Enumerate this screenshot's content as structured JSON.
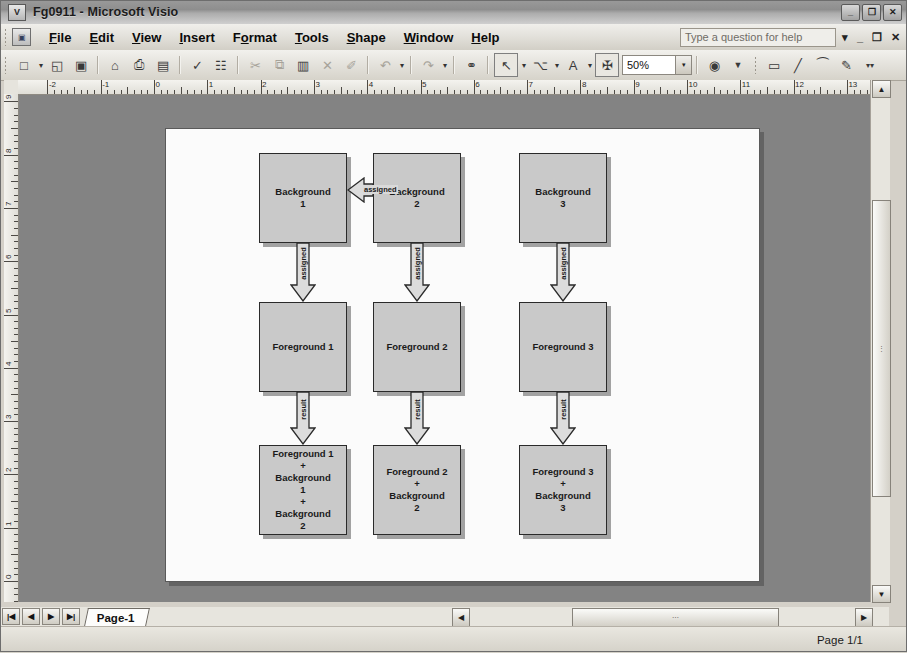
{
  "window": {
    "title": "Fg0911 - Microsoft Visio",
    "app_icon": "visio-icon",
    "minimize_label": "_",
    "restore_label": "❐",
    "close_label": "✕"
  },
  "menubar": {
    "doc_icon": "document-icon",
    "items": [
      {
        "label": "File",
        "accel": "F"
      },
      {
        "label": "Edit",
        "accel": "E"
      },
      {
        "label": "View",
        "accel": "V"
      },
      {
        "label": "Insert",
        "accel": "I"
      },
      {
        "label": "Format",
        "accel": "o"
      },
      {
        "label": "Tools",
        "accel": "T"
      },
      {
        "label": "Shape",
        "accel": "S"
      },
      {
        "label": "Window",
        "accel": "W"
      },
      {
        "label": "Help",
        "accel": "H"
      }
    ],
    "help_placeholder": "Type a question for help",
    "help_dropdown": "▾",
    "doc_minimize": "_",
    "doc_restore": "❐",
    "doc_close": "✕"
  },
  "toolbar": {
    "zoom_value": "50%",
    "zoom_dropdown": "▾",
    "buttons": [
      {
        "name": "new-document-button",
        "glyph": "□",
        "enabled": true
      },
      {
        "name": "new-dropdown-button",
        "glyph": "▾",
        "enabled": true
      },
      {
        "name": "open-button",
        "glyph": "◱",
        "enabled": true
      },
      {
        "name": "save-button",
        "glyph": "▣",
        "enabled": true
      },
      {
        "name": "permission-button",
        "glyph": "⌂",
        "enabled": true
      },
      {
        "name": "print-button",
        "glyph": "⎙",
        "enabled": true
      },
      {
        "name": "print-preview-button",
        "glyph": "▤",
        "enabled": true
      },
      {
        "name": "spelling-button",
        "glyph": "✓",
        "enabled": true
      },
      {
        "name": "research-button",
        "glyph": "☷",
        "enabled": true
      },
      {
        "name": "cut-button",
        "glyph": "✂",
        "enabled": false
      },
      {
        "name": "copy-button",
        "glyph": "⧉",
        "enabled": false
      },
      {
        "name": "paste-button",
        "glyph": "▥",
        "enabled": true
      },
      {
        "name": "delete-button",
        "glyph": "✕",
        "enabled": false
      },
      {
        "name": "format-painter-button",
        "glyph": "✐",
        "enabled": false
      },
      {
        "name": "undo-button",
        "glyph": "↶",
        "enabled": false
      },
      {
        "name": "undo-dropdown-button",
        "glyph": "▾",
        "enabled": false
      },
      {
        "name": "redo-button",
        "glyph": "↷",
        "enabled": false
      },
      {
        "name": "redo-dropdown-button",
        "glyph": "▾",
        "enabled": false
      },
      {
        "name": "hyperlink-button",
        "glyph": "⚭",
        "enabled": true
      },
      {
        "name": "pointer-tool-button",
        "glyph": "↖",
        "enabled": true,
        "framed": true
      },
      {
        "name": "pointer-dropdown-button",
        "glyph": "▾",
        "enabled": true
      },
      {
        "name": "connector-tool-button",
        "glyph": "⌥",
        "enabled": true
      },
      {
        "name": "connector-dropdown-button",
        "glyph": "▾",
        "enabled": true
      },
      {
        "name": "text-tool-button",
        "glyph": "A",
        "enabled": true
      },
      {
        "name": "text-dropdown-button",
        "glyph": "▾",
        "enabled": true
      },
      {
        "name": "freeform-tool-button",
        "glyph": "✠",
        "enabled": true,
        "framed": true
      }
    ],
    "right_buttons": [
      {
        "name": "help-round-button",
        "glyph": "?"
      },
      {
        "name": "toolbar-overflow-button",
        "glyph": "»"
      },
      {
        "name": "rectangle-tool-button",
        "glyph": "▭"
      },
      {
        "name": "line-tool-button",
        "glyph": "╱"
      },
      {
        "name": "arc-tool-button",
        "glyph": "◜"
      },
      {
        "name": "pencil-tool-button",
        "glyph": "✎"
      },
      {
        "name": "toolbar-more-button",
        "glyph": "»"
      }
    ]
  },
  "rulers": {
    "horizontal_labels": [
      "-2",
      "-1",
      "0",
      "1",
      "2",
      "3",
      "4",
      "5",
      "6",
      "7",
      "8",
      "9",
      "10",
      "11",
      "12",
      "13"
    ],
    "vertical_labels": [
      "9",
      "8",
      "7",
      "6",
      "5",
      "4",
      "3",
      "2",
      "1",
      "0"
    ],
    "units": "inches"
  },
  "diagram": {
    "shapes": [
      {
        "id": "bg1",
        "text": [
          "Background",
          "1"
        ],
        "x": 93,
        "y": 24,
        "w": 88,
        "h": 90
      },
      {
        "id": "bg2",
        "text": [
          "Background",
          "2"
        ],
        "x": 207,
        "y": 24,
        "w": 88,
        "h": 90
      },
      {
        "id": "bg3",
        "text": [
          "Background",
          "3"
        ],
        "x": 353,
        "y": 24,
        "w": 88,
        "h": 90
      },
      {
        "id": "fg1",
        "text": [
          "Foreground 1"
        ],
        "x": 93,
        "y": 173,
        "w": 88,
        "h": 90
      },
      {
        "id": "fg2",
        "text": [
          "Foreground 2"
        ],
        "x": 207,
        "y": 173,
        "w": 88,
        "h": 90
      },
      {
        "id": "fg3",
        "text": [
          "Foreground 3"
        ],
        "x": 353,
        "y": 173,
        "w": 88,
        "h": 90
      },
      {
        "id": "res1",
        "text": [
          "Foreground 1",
          "+",
          "Background",
          "1",
          "+",
          "Background",
          "2"
        ],
        "x": 93,
        "y": 316,
        "w": 88,
        "h": 90
      },
      {
        "id": "res2",
        "text": [
          "Foreground 2",
          "+",
          "Background",
          "2"
        ],
        "x": 207,
        "y": 316,
        "w": 88,
        "h": 90
      },
      {
        "id": "res3",
        "text": [
          "Foreground 3",
          "+",
          "Background",
          "3"
        ],
        "x": 353,
        "y": 316,
        "w": 88,
        "h": 90
      }
    ],
    "connectors": [
      {
        "id": "c-bg2-bg1",
        "label": "assigned",
        "from": "bg2",
        "to": "bg1",
        "direction": "left"
      },
      {
        "id": "c-bg1-fg1",
        "label": "assigned",
        "from": "bg1",
        "to": "fg1",
        "direction": "down"
      },
      {
        "id": "c-bg2-fg2",
        "label": "assigned",
        "from": "bg2",
        "to": "fg2",
        "direction": "down"
      },
      {
        "id": "c-bg3-fg3",
        "label": "assigned",
        "from": "bg3",
        "to": "fg3",
        "direction": "down"
      },
      {
        "id": "c-fg1-res1",
        "label": "result",
        "from": "fg1",
        "to": "res1",
        "direction": "down"
      },
      {
        "id": "c-fg2-res2",
        "label": "result",
        "from": "fg2",
        "to": "res2",
        "direction": "down"
      },
      {
        "id": "c-fg3-res3",
        "label": "result",
        "from": "fg3",
        "to": "res3",
        "direction": "down"
      }
    ]
  },
  "scrollbars": {
    "v_up": "▲",
    "v_down": "▼",
    "v_grip": "⋮",
    "h_left": "◀",
    "h_right": "▶",
    "h_grip": "⋯"
  },
  "page_tabs": {
    "first_label": "⏮",
    "prev_label": "◀",
    "next_label": "▶",
    "last_label": "⏭",
    "tabs": [
      {
        "label": "Page-1",
        "active": true
      }
    ]
  },
  "statusbar": {
    "page_info": "Page 1/1"
  }
}
